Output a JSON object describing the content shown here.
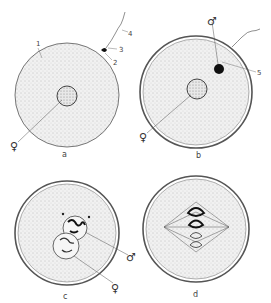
{
  "figure": {
    "panels": [
      {
        "id": "a",
        "label": "a",
        "callouts": [
          "1",
          "2",
          "3",
          "4"
        ],
        "symbols": [
          "female"
        ]
      },
      {
        "id": "b",
        "label": "b",
        "callouts": [
          "5"
        ],
        "symbols": [
          "male",
          "female"
        ]
      },
      {
        "id": "c",
        "label": "c",
        "callouts": [],
        "symbols": [
          "male",
          "female"
        ]
      },
      {
        "id": "d",
        "label": "d",
        "callouts": [],
        "symbols": []
      }
    ],
    "callout_numbers": {
      "n1": "1",
      "n2": "2",
      "n3": "3",
      "n4": "4",
      "n5": "5"
    },
    "symbols": {
      "female": "♀",
      "male": "♂"
    },
    "colors": {
      "ink": "#333333",
      "stipple": "#8a8a8a",
      "background": "#ffffff",
      "cytoplasm": "#efefef"
    }
  }
}
